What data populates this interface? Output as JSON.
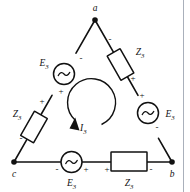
{
  "figure": {
    "type": "delta-connected-three-phase-circuit",
    "background_color": "#ffffff",
    "line_color": "#111111",
    "margin_rule_color": "#aab0bb"
  },
  "nodes": [
    {
      "id": "a",
      "label": "a",
      "x": 95,
      "y": 20
    },
    {
      "id": "b",
      "label": "b",
      "x": 172,
      "y": 162
    },
    {
      "id": "c",
      "label": "c",
      "x": 14,
      "y": 162
    }
  ],
  "branches": [
    {
      "id": "branch-ca",
      "from": "c",
      "to": "a",
      "components": [
        {
          "kind": "voltage-source",
          "label": "E",
          "subscript": "3",
          "label_full": "E3",
          "terminal_marks": {
            "near_a": "-",
            "near_c": "+"
          }
        },
        {
          "kind": "impedance",
          "label": "Z",
          "subscript": "3",
          "label_full": "Z3",
          "terminal_marks": {
            "near_a": "+",
            "near_c": "-"
          }
        }
      ]
    },
    {
      "id": "branch-ab",
      "from": "a",
      "to": "b",
      "components": [
        {
          "kind": "impedance",
          "label": "Z",
          "subscript": "3",
          "label_full": "Z3",
          "terminal_marks": {
            "near_a": "-",
            "near_b": "+"
          }
        },
        {
          "kind": "voltage-source",
          "label": "E",
          "subscript": "3",
          "label_full": "E3",
          "terminal_marks": {
            "near_a": "+",
            "near_b": "-"
          }
        }
      ]
    },
    {
      "id": "branch-cb",
      "from": "c",
      "to": "b",
      "components": [
        {
          "kind": "voltage-source",
          "label": "E",
          "subscript": "3",
          "label_full": "E3",
          "terminal_marks": {
            "near_c": "-",
            "near_b": "+"
          }
        },
        {
          "kind": "impedance",
          "label": "Z",
          "subscript": "3",
          "label_full": "Z3",
          "terminal_marks": {
            "near_c": "+",
            "near_b": "-"
          }
        }
      ]
    }
  ],
  "mesh_current": {
    "label": "I",
    "subscript": "3",
    "label_full": "I3",
    "direction": "clockwise-arc-arrow-pointing-down-left",
    "x": 82,
    "y": 128
  },
  "signs": {
    "plus": "+",
    "minus": "-"
  }
}
